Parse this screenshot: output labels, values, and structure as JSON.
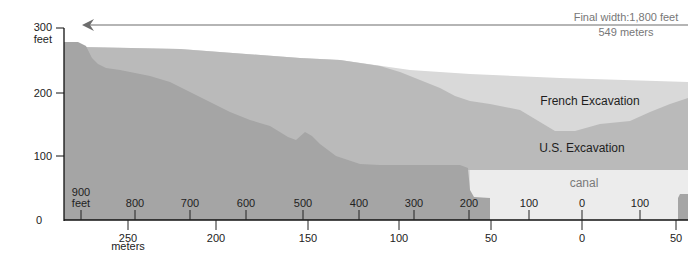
{
  "diagram": {
    "type": "cross-section",
    "width_note": {
      "line1": "Final width:1,800 feet",
      "line2": "549 meters"
    },
    "y_axis": {
      "ticks": [
        "300",
        "200",
        "100",
        "0"
      ],
      "unit": "feet"
    },
    "x_axis_feet": {
      "ticks": [
        "900",
        "800",
        "700",
        "600",
        "500",
        "400",
        "300",
        "200",
        "100",
        "0",
        "100"
      ],
      "unit": "feet"
    },
    "x_axis_meters": {
      "ticks": [
        "250",
        "200",
        "150",
        "100",
        "50",
        "0",
        "50"
      ],
      "unit": "meters"
    },
    "regions": {
      "french": "French Excavation",
      "us": "U.S. Excavation",
      "canal": "canal"
    },
    "colors": {
      "remaining_ground": "#a3a3a3",
      "us_excavation": "#b9b9b9",
      "french_excavation": "#d7d7d7",
      "canal": "#ececec",
      "axis": "#111111",
      "arrow": "#6d6d6d"
    }
  }
}
